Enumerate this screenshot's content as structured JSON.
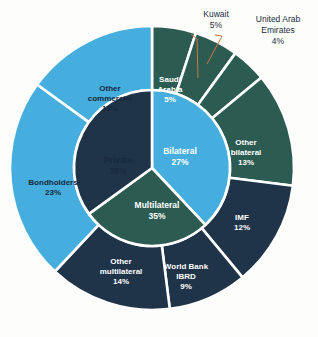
{
  "chart_data": {
    "type": "pie",
    "title": "",
    "subtitle": "",
    "xlabel": "",
    "ylabel": "",
    "legend_position": "none",
    "grid": false,
    "layout": "nested-donut",
    "center": {
      "x": 152,
      "y": 168
    },
    "radii": {
      "inner_hole": 0,
      "inner_ring_outer": 78,
      "outer_ring_outer": 142
    },
    "start_angle_deg": 0,
    "direction": "clockwise",
    "rings": [
      {
        "name": "inner",
        "slices": [
          {
            "label": "Private",
            "value_pct": 38,
            "value_text": "38%",
            "color": "#45aede",
            "text_color": "#17293c"
          },
          {
            "label": "Bilateral",
            "value_pct": 27,
            "value_text": "27%",
            "color": "#2c5b52",
            "text_color": "#ffffff"
          },
          {
            "label": "Multilateral",
            "value_pct": 35,
            "value_text": "35%",
            "color": "#1f3349",
            "text_color": "#ffffff"
          }
        ]
      },
      {
        "name": "outer",
        "slices": [
          {
            "label": "Saudi Arabia",
            "value_pct": 5,
            "value_text": "5%",
            "color": "#2c5b52",
            "text_color": "#ffffff",
            "parent": "Bilateral",
            "callout": false
          },
          {
            "label": "Kuwait",
            "value_pct": 5,
            "value_text": "5%",
            "color": "#2c5b52",
            "text_color": "#ffffff",
            "parent": "Bilateral",
            "callout": true
          },
          {
            "label": "United Arab Emirates",
            "value_pct": 4,
            "value_text": "4%",
            "color": "#2c5b52",
            "text_color": "#ffffff",
            "parent": "Bilateral",
            "callout": true
          },
          {
            "label": "Other bilateral",
            "value_pct": 13,
            "value_text": "13%",
            "color": "#2c5b52",
            "text_color": "#ffffff",
            "parent": "Bilateral",
            "callout": false
          },
          {
            "label": "IMF",
            "value_pct": 12,
            "value_text": "12%",
            "color": "#1f3349",
            "text_color": "#ffffff",
            "parent": "Multilateral",
            "callout": false
          },
          {
            "label": "World Bank IBRD",
            "value_pct": 9,
            "value_text": "9%",
            "color": "#1f3349",
            "text_color": "#ffffff",
            "parent": "Multilateral",
            "callout": false
          },
          {
            "label": "Other multilateral",
            "value_pct": 14,
            "value_text": "14%",
            "color": "#1f3349",
            "text_color": "#ffffff",
            "parent": "Multilateral",
            "callout": false
          },
          {
            "label": "Bondholders",
            "value_pct": 23,
            "value_text": "23%",
            "color": "#45aede",
            "text_color": "#17293c",
            "parent": "Private",
            "callout": false
          },
          {
            "label": "Other commercial",
            "value_pct": 15,
            "value_text": "15%",
            "color": "#45aede",
            "text_color": "#17293c",
            "parent": "Private",
            "callout": false
          }
        ]
      }
    ],
    "colors": {
      "private_light_blue": "#45aede",
      "bilateral_green": "#2c5b52",
      "multilateral_navy": "#1f3349",
      "separator_white": "#ffffff",
      "leader_line_orange": "#d2763f",
      "background": "#fdfdfc",
      "dark_text": "#17293c",
      "light_text": "#ffffff"
    }
  },
  "labels": {
    "private": {
      "name": "Private",
      "pct": "38%"
    },
    "bilateral": {
      "name": "Bilateral",
      "pct": "27%"
    },
    "multilateral": {
      "name": "Multilateral",
      "pct": "35%"
    },
    "saudi_arabia": {
      "line1": "Saudi",
      "line2": "Arabia",
      "pct": "5%"
    },
    "other_bilateral": {
      "line1": "Other",
      "line2": "bilateral",
      "pct": "13%"
    },
    "imf": {
      "name": "IMF",
      "pct": "12%"
    },
    "world_bank": {
      "line1": "World Bank",
      "line2": "IBRD",
      "pct": "9%"
    },
    "other_multilateral": {
      "line1": "Other",
      "line2": "multilateral",
      "pct": "14%"
    },
    "bondholders": {
      "name": "Bondholders",
      "pct": "23%"
    },
    "other_commercial": {
      "line1": "Other",
      "line2": "commercial",
      "pct": "15%"
    }
  },
  "callouts": {
    "kuwait": {
      "name": "Kuwait",
      "pct": "5%"
    },
    "uae": {
      "line1": "United Arab",
      "line2": "Emirates",
      "pct": "4%"
    }
  }
}
